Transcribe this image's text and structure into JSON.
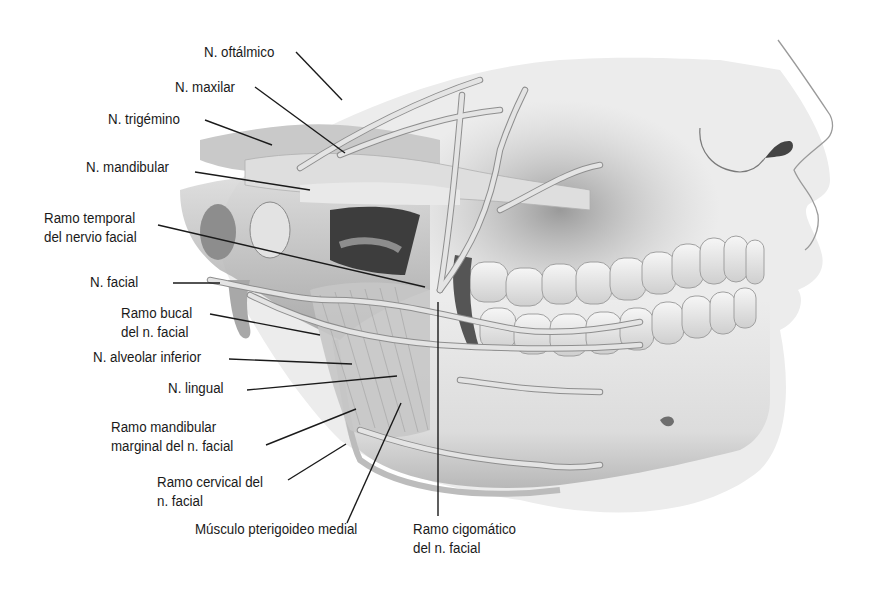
{
  "figure": {
    "colors": {
      "background": "#ffffff",
      "label_text": "#1a1a1a",
      "leader_line": "#1a1a1a",
      "bone_light": "#e6e6e6",
      "bone_mid": "#c4c4c4",
      "shadow": "#8a8a8a",
      "nerve": "#d9d9d9"
    },
    "labels": [
      {
        "id": "oftalmico",
        "lines": [
          "N. oftálmico"
        ]
      },
      {
        "id": "maxilar",
        "lines": [
          "N. maxilar"
        ]
      },
      {
        "id": "trigemino",
        "lines": [
          "N. trigémino"
        ]
      },
      {
        "id": "mandibular",
        "lines": [
          "N. mandibular"
        ]
      },
      {
        "id": "temporal",
        "lines": [
          "Ramo temporal",
          "del nervio facial"
        ]
      },
      {
        "id": "facial",
        "lines": [
          "N. facial"
        ]
      },
      {
        "id": "bucal",
        "lines": [
          "Ramo bucal",
          "del n. facial"
        ]
      },
      {
        "id": "alveolar",
        "lines": [
          "N. alveolar inferior"
        ]
      },
      {
        "id": "lingual",
        "lines": [
          "N. lingual"
        ]
      },
      {
        "id": "mandibular_marginal",
        "lines": [
          "Ramo mandibular",
          "marginal del n. facial"
        ]
      },
      {
        "id": "cervical",
        "lines": [
          "Ramo cervical del",
          "n. facial"
        ]
      },
      {
        "id": "pterigoideo",
        "lines": [
          "Músculo pterigoideo medial"
        ]
      },
      {
        "id": "cigomatico",
        "lines": [
          "Ramo cigomático",
          "del n. facial"
        ]
      }
    ]
  }
}
